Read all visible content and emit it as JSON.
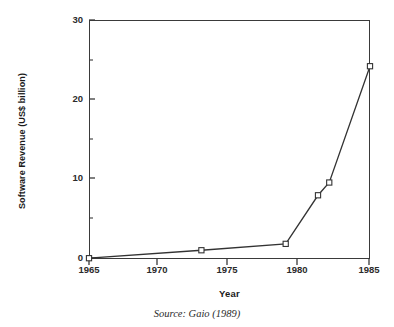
{
  "chart_data": {
    "type": "line",
    "title": "",
    "xlabel": "Year",
    "ylabel": "Software Revenue (US$ billion)",
    "xlim": [
      1965,
      1985
    ],
    "ylim": [
      0,
      30
    ],
    "grid": false,
    "legend": null,
    "marker": "open-square",
    "x": [
      1965,
      1973,
      1979,
      1981.3,
      1982.1,
      1985
    ],
    "y": [
      0.1,
      1.1,
      1.9,
      8.0,
      9.6,
      24.2
    ],
    "series": [
      {
        "name": "Software Revenue",
        "points": [
          {
            "x": 1965,
            "y": 0.1
          },
          {
            "x": 1973,
            "y": 1.1
          },
          {
            "x": 1979,
            "y": 1.9
          },
          {
            "x": 1981.3,
            "y": 8.0
          },
          {
            "x": 1982.1,
            "y": 9.6
          },
          {
            "x": 1985,
            "y": 24.2
          }
        ]
      }
    ],
    "x_ticks": [
      1965,
      1970,
      1975,
      1980,
      1985
    ],
    "x_tick_labels": [
      "1965",
      "1970",
      "1975",
      "1980",
      "1985"
    ],
    "y_ticks": [
      0,
      10,
      20,
      30
    ],
    "y_tick_labels": [
      "0",
      "10",
      "20",
      "30"
    ],
    "y_minor_ticks": [
      5,
      15,
      25
    ],
    "line_color": "#333333",
    "marker_face_color": "#ffffff",
    "marker_edge_color": "#333333",
    "axis_color": "#3a3a3a"
  },
  "caption": {
    "source": "Source: Gaio (1989)"
  }
}
